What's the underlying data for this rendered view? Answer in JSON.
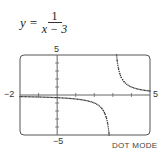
{
  "equation": {
    "lhs": "y =",
    "numerator": "1",
    "denominator": "x − 3"
  },
  "window_labels": {
    "xmin": "−2",
    "xmax": "5",
    "ymin": "−5",
    "ymax": "5"
  },
  "mode_label": "DOT MODE",
  "chart_data": {
    "type": "scatter",
    "function": "1/(x-3)",
    "xlabel": "",
    "ylabel": "",
    "xlim": [
      -2,
      5
    ],
    "ylim": [
      -5,
      5
    ],
    "xscale": 1,
    "yscale": 1,
    "vertical_asymptote": 3,
    "horizontal_asymptote": 0,
    "render_mode": "dot",
    "grid": false,
    "x_ticks": [
      -1,
      1,
      2,
      3,
      4
    ],
    "y_ticks": [
      -4,
      -3,
      -2,
      -1,
      1,
      2,
      3,
      4
    ],
    "sample_points": [
      {
        "x": -2,
        "y": -0.2
      },
      {
        "x": -1,
        "y": -0.25
      },
      {
        "x": 0,
        "y": -0.333
      },
      {
        "x": 1,
        "y": -0.5
      },
      {
        "x": 2,
        "y": -1
      },
      {
        "x": 2.5,
        "y": -2
      },
      {
        "x": 2.8,
        "y": -5
      },
      {
        "x": 3.2,
        "y": 5
      },
      {
        "x": 3.5,
        "y": 2
      },
      {
        "x": 4,
        "y": 1
      },
      {
        "x": 5,
        "y": 0.5
      }
    ],
    "colors": {
      "curve": "#333333",
      "frame": "#555555",
      "axes": "#666666"
    }
  }
}
